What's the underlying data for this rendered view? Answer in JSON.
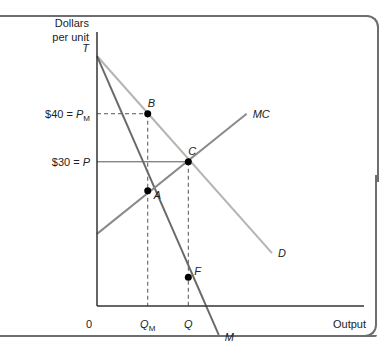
{
  "chart_data": {
    "type": "line",
    "title": "",
    "xlabel": "Output",
    "ylabel": "Dollars per unit",
    "ylabel_lines": [
      "Dollars",
      "per unit"
    ],
    "origin_label": "0",
    "x_ticks": [
      {
        "label": "Q",
        "sub": "M",
        "x": 0.2
      },
      {
        "label": "Q",
        "sub": "",
        "x": 0.36
      }
    ],
    "y_ticks": [
      {
        "label": "$40 = P",
        "sub": "M",
        "y": 40
      },
      {
        "label": "$30 = P",
        "sub": "",
        "y": 30
      }
    ],
    "xlim": [
      0,
      1
    ],
    "ylim": [
      0,
      57
    ],
    "series": [
      {
        "name": "D",
        "color": "#b4b4b4",
        "points": [
          [
            0,
            52
          ],
          [
            0.69,
            11
          ]
        ]
      },
      {
        "name": "M",
        "color": "#6a6a6a",
        "points": [
          [
            0,
            52
          ],
          [
            0.48,
            -6
          ]
        ]
      },
      {
        "name": "MC",
        "color": "#8a8a8a",
        "points": [
          [
            0,
            15
          ],
          [
            0.59,
            40
          ]
        ]
      }
    ],
    "points": [
      {
        "name": "T",
        "x": 0,
        "y": 52,
        "dot": false
      },
      {
        "name": "B",
        "x": 0.2,
        "y": 40,
        "dot": true
      },
      {
        "name": "C",
        "x": 0.36,
        "y": 30,
        "dot": true
      },
      {
        "name": "A",
        "x": 0.2,
        "y": 24,
        "dot": true
      },
      {
        "name": "F",
        "x": 0.36,
        "y": 6,
        "dot": true
      }
    ],
    "guides": [
      {
        "from": [
          0,
          40
        ],
        "to": [
          0.2,
          40
        ],
        "style": "dashed"
      },
      {
        "from": [
          0.2,
          40
        ],
        "to": [
          0.2,
          0
        ],
        "style": "dashed"
      },
      {
        "from": [
          0,
          30
        ],
        "to": [
          0.36,
          30
        ],
        "style": "solid"
      },
      {
        "from": [
          0.36,
          30
        ],
        "to": [
          0.36,
          0
        ],
        "style": "dashed"
      }
    ],
    "grid": false,
    "legend": "none"
  }
}
